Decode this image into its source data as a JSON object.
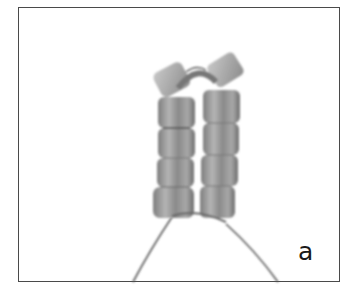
{
  "figure": {
    "panel_label": "a",
    "bead_color": "#9a9a9a",
    "bead_highlight": "#cfcfcf",
    "bead_shadow": "#5e5e5e",
    "thread_color": "#555555",
    "border_color": "#4a4a4a",
    "columns": [
      {
        "side": "left",
        "bead_count": 5
      },
      {
        "side": "right",
        "bead_count": 5
      }
    ]
  }
}
